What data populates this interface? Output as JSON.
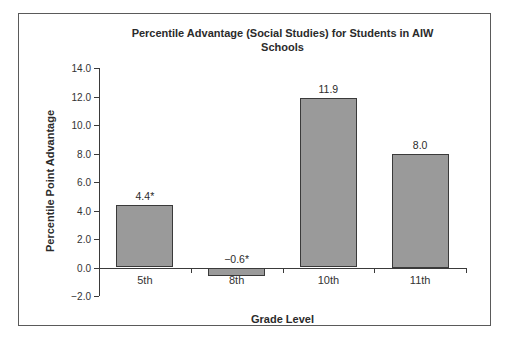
{
  "chart_data": {
    "type": "bar",
    "title": "Percentile Advantage (Social Studies) for Students in AIW Schools",
    "title_lines": [
      "Percentile Advantage (Social Studies) for Students in AIW",
      "Schools"
    ],
    "xlabel": "Grade Level",
    "ylabel": "Percentile Point Advantage",
    "categories": [
      "5th",
      "8th",
      "10th",
      "11th"
    ],
    "values": [
      4.4,
      -0.6,
      11.9,
      8.0
    ],
    "value_labels": [
      "4.4*",
      "−0.6*",
      "11.9",
      "8.0"
    ],
    "ylim": [
      -2.0,
      14.0
    ],
    "ytick_step": 2.0,
    "yticks": [
      "14.0",
      "12.0",
      "10.0",
      "8.0",
      "6.0",
      "4.0",
      "2.0",
      "0.0",
      "−2.0"
    ],
    "grid": false,
    "legend": "none",
    "colors": {
      "bar_fill": "#9a9a9a",
      "bar_border": "#3a3a3a",
      "axis": "#3a3a3a",
      "text": "#2b2b2b",
      "frame_border": "#5a5a5a",
      "background": "#ffffff"
    }
  }
}
